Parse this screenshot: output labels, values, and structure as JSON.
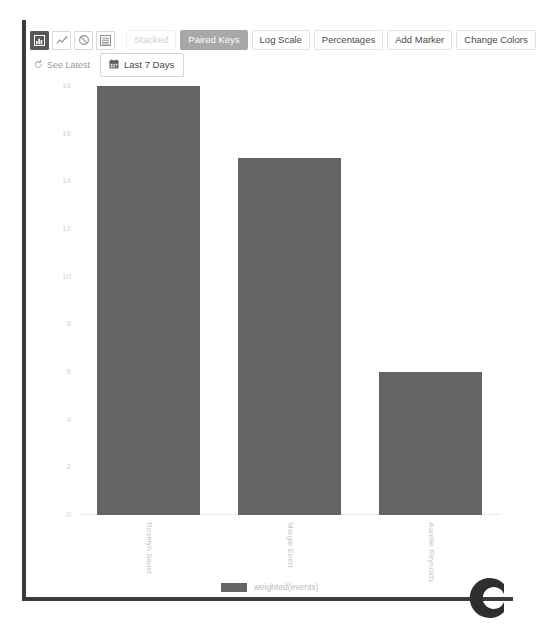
{
  "toolbar": {
    "icons": [
      {
        "name": "bar-chart-icon",
        "label": "bar-chart-icon",
        "active": true
      },
      {
        "name": "line-chart-icon",
        "label": "line-chart-icon",
        "active": false
      },
      {
        "name": "no-chart-icon",
        "label": "no-chart-icon",
        "active": false
      },
      {
        "name": "table-view-icon",
        "label": "table-view-icon",
        "active": false
      }
    ],
    "stacked_label": "Stacked",
    "paired_keys_label": "Paired Keys",
    "log_scale_label": "Log Scale",
    "percentages_label": "Percentages",
    "add_marker_label": "Add Marker",
    "change_colors_label": "Change Colors"
  },
  "subbar": {
    "see_latest_label": "See Latest",
    "refresh_icon": "refresh-icon",
    "calendar_icon": "calendar-icon",
    "date_range_label": "Last 7 Days"
  },
  "legend": {
    "series_label": "weighted(events)",
    "swatch_color": "#646464"
  },
  "branding": {
    "corner_logo": "c-logo"
  },
  "colors": {
    "bar": "#646464",
    "active_button_bg": "#a8a8a8",
    "active_icon_bg": "#585858",
    "axis_text": "#d2d2d2",
    "frame": "#3c3c3c"
  },
  "chart_data": {
    "type": "bar",
    "title": "",
    "xlabel": "",
    "ylabel": "",
    "categories": [
      "Roselyn Sauer",
      "Margie Ebert",
      "Aurelie Reynolds"
    ],
    "values": [
      18,
      15,
      6
    ],
    "series": [
      {
        "name": "weighted(events)",
        "values": [
          18,
          15,
          6
        ],
        "color": "#646464"
      }
    ],
    "ylim": [
      0,
      18
    ],
    "yticks": [
      0,
      2,
      4,
      6,
      8,
      10,
      12,
      14,
      16,
      18
    ],
    "ytick_labels": [
      "0",
      "2",
      "4",
      "6",
      "8",
      "10",
      "12",
      "14",
      "16",
      "18"
    ],
    "grid": false,
    "legend_position": "bottom",
    "xtick_rotation": 90
  }
}
